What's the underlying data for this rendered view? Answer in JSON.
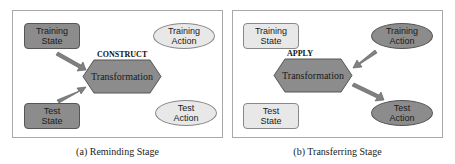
{
  "panels": [
    {
      "caption": "(a) Reminding Stage",
      "operation": "CONSTRUCT",
      "center": "Transformation",
      "training_state": {
        "line1": "Training",
        "line2": "State",
        "highlighted": true
      },
      "test_state": {
        "line1": "Test",
        "line2": "State",
        "highlighted": true
      },
      "training_action": {
        "line1": "Training",
        "line2": "Action",
        "highlighted": false
      },
      "test_action": {
        "line1": "Test",
        "line2": "Action",
        "highlighted": false
      }
    },
    {
      "caption": "(b) Transferring Stage",
      "operation": "APPLY",
      "center": "Transformation",
      "training_state": {
        "line1": "Training",
        "line2": "State",
        "highlighted": false
      },
      "test_state": {
        "line1": "Test",
        "line2": "State",
        "highlighted": false
      },
      "training_action": {
        "line1": "Training",
        "line2": "Action",
        "highlighted": true
      },
      "test_action": {
        "line1": "Test",
        "line2": "Action",
        "highlighted": true
      }
    }
  ],
  "colors": {
    "highlighted_fill": "#8c8c8c",
    "muted_fill": "#e8e8e8",
    "arrow": "#808080",
    "border": "#a8a8a8"
  }
}
